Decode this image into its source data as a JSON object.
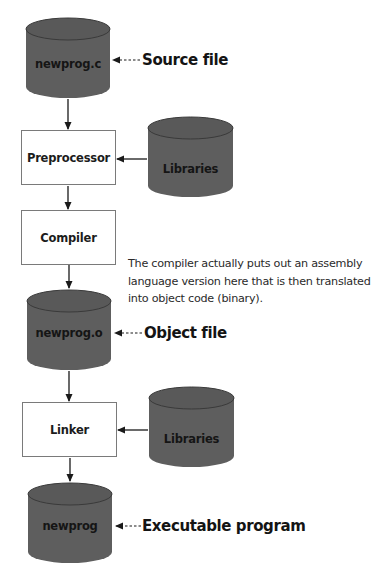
{
  "diagram": {
    "colors": {
      "cylinder_fill": "#5e5e5e",
      "cylinder_top": "#595959",
      "cylinder_outline": "#3a3a3a",
      "box_border": "#7a7a7a",
      "arrow": "#1a1a1a",
      "text": "#151515"
    },
    "nodes": {
      "source": {
        "type": "cylinder",
        "label": "newprog.c"
      },
      "preprocessor": {
        "type": "process",
        "label": "Preprocessor"
      },
      "libraries_1": {
        "type": "cylinder",
        "label": "Libraries"
      },
      "compiler": {
        "type": "process",
        "label": "Compiler"
      },
      "object": {
        "type": "cylinder",
        "label": "newprog.o"
      },
      "linker": {
        "type": "process",
        "label": "Linker"
      },
      "libraries_2": {
        "type": "cylinder",
        "label": "Libraries"
      },
      "executable": {
        "type": "cylinder",
        "label": "newprog"
      }
    },
    "callouts": {
      "source": "Source file",
      "object": "Object file",
      "executable": "Executable program"
    },
    "annotation": {
      "lines": [
        "The compiler actually puts out an assembly",
        "language version here that is then translated",
        "into object code (binary)."
      ]
    },
    "edges": [
      {
        "from": "source",
        "to": "preprocessor",
        "style": "solid"
      },
      {
        "from": "libraries_1",
        "to": "preprocessor",
        "style": "solid"
      },
      {
        "from": "preprocessor",
        "to": "compiler",
        "style": "solid"
      },
      {
        "from": "compiler",
        "to": "object",
        "style": "solid"
      },
      {
        "from": "object",
        "to": "linker",
        "style": "solid"
      },
      {
        "from": "libraries_2",
        "to": "linker",
        "style": "solid"
      },
      {
        "from": "linker",
        "to": "executable",
        "style": "solid"
      }
    ]
  }
}
